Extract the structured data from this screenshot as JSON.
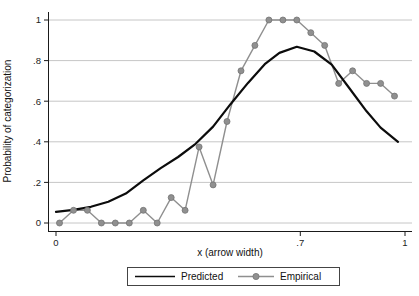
{
  "colors": {
    "background": "#ffffff",
    "gridline": "#c6c6c6",
    "axis": "#1a1a1a",
    "tick_text": "#222222",
    "predicted_line": "#0c0c0c",
    "empirical_line": "#8f8f8f",
    "empirical_marker_fill": "#909090",
    "empirical_marker_edge": "#737373"
  },
  "chart_data": {
    "type": "line",
    "title": "",
    "xlabel": "x (arrow width)",
    "ylabel": "Probability of categorization",
    "xlim": [
      0,
      1.02
    ],
    "ylim": [
      0,
      1
    ],
    "grid": "horizontal",
    "legend_position": "bottom",
    "x_ticks": [
      {
        "v": 0,
        "label": "0"
      },
      {
        "v": 0.7,
        "label": ".7"
      },
      {
        "v": 1,
        "label": "1"
      }
    ],
    "y_ticks": [
      {
        "v": 0,
        "label": "0"
      },
      {
        "v": 0.2,
        "label": ".2"
      },
      {
        "v": 0.4,
        "label": ".4"
      },
      {
        "v": 0.6,
        "label": ".6"
      },
      {
        "v": 0.8,
        "label": ".8"
      },
      {
        "v": 1,
        "label": "1"
      }
    ],
    "series": [
      {
        "name": "Predicted",
        "type": "line",
        "marker": "none",
        "color": "#0c0c0c",
        "x": [
          0.0,
          0.05,
          0.1,
          0.15,
          0.2,
          0.25,
          0.3,
          0.35,
          0.4,
          0.45,
          0.5,
          0.55,
          0.6,
          0.64,
          0.69,
          0.74,
          0.79,
          0.84,
          0.89,
          0.93,
          0.98
        ],
        "y": [
          0.055,
          0.065,
          0.08,
          0.105,
          0.145,
          0.21,
          0.27,
          0.325,
          0.39,
          0.475,
          0.585,
          0.69,
          0.785,
          0.838,
          0.868,
          0.845,
          0.78,
          0.665,
          0.55,
          0.47,
          0.4
        ]
      },
      {
        "name": "Empirical",
        "type": "line+marker",
        "marker": "circle",
        "color": "#8f8f8f",
        "x": [
          0.01,
          0.05,
          0.09,
          0.13,
          0.17,
          0.21,
          0.25,
          0.29,
          0.33,
          0.37,
          0.41,
          0.45,
          0.49,
          0.53,
          0.57,
          0.61,
          0.65,
          0.69,
          0.73,
          0.77,
          0.81,
          0.85,
          0.89,
          0.93,
          0.97
        ],
        "y": [
          0,
          0.0625,
          0.0625,
          0,
          0,
          0,
          0.0625,
          0,
          0.125,
          0.0625,
          0.375,
          0.1875,
          0.5,
          0.75,
          0.875,
          1,
          1,
          1,
          0.9375,
          0.875,
          0.6875,
          0.75,
          0.6875,
          0.6875,
          0.625
        ]
      }
    ]
  }
}
